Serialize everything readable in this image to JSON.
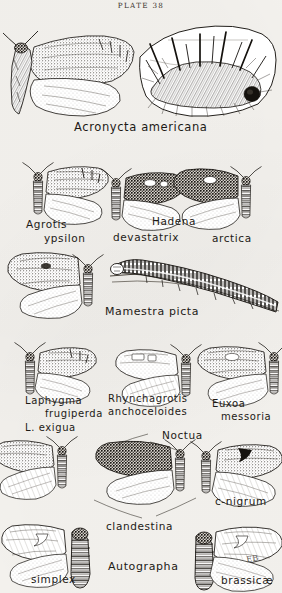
{
  "plate": {
    "header": "PLATE 38",
    "signature": "EB",
    "ink_color": "#16130f",
    "paper_color": "#f6f4f0"
  },
  "captions": [
    {
      "id": "acronycta-americana",
      "text": "Acronycta americana",
      "x": 74,
      "y": 122,
      "size": 11.5
    },
    {
      "id": "agrotis",
      "text": "Agrotis",
      "x": 26,
      "y": 219,
      "size": 10.5
    },
    {
      "id": "ypsilon",
      "text": "ypsilon",
      "x": 44,
      "y": 233,
      "size": 10.5
    },
    {
      "id": "hadena",
      "text": "Hadena",
      "x": 152,
      "y": 216,
      "size": 10.5
    },
    {
      "id": "devastatrix",
      "text": "devastatrix",
      "x": 113,
      "y": 232,
      "size": 10.5
    },
    {
      "id": "arctica",
      "text": "arctica",
      "x": 212,
      "y": 233,
      "size": 10.5
    },
    {
      "id": "mamestra-picta",
      "text": "Mamestra picta",
      "x": 105,
      "y": 306,
      "size": 11
    },
    {
      "id": "laphygma",
      "text": "Laphygma",
      "x": 25,
      "y": 396,
      "size": 10
    },
    {
      "id": "frugiperda",
      "text": "frugiperda",
      "x": 45,
      "y": 409,
      "size": 10
    },
    {
      "id": "l-exigua",
      "text": "L. exigua",
      "x": 25,
      "y": 423,
      "size": 10
    },
    {
      "id": "rhynchagrotis",
      "text": "Rhynchagrotis",
      "x": 108,
      "y": 394,
      "size": 10
    },
    {
      "id": "anchoceloides",
      "text": "anchoceloides",
      "x": 108,
      "y": 407,
      "size": 10
    },
    {
      "id": "euxoa",
      "text": "Euxoa",
      "x": 212,
      "y": 399,
      "size": 10
    },
    {
      "id": "messoria",
      "text": "messoria",
      "x": 221,
      "y": 412,
      "size": 10
    },
    {
      "id": "noctua",
      "text": "Noctua",
      "x": 162,
      "y": 430,
      "size": 10.5
    },
    {
      "id": "c-nigrum",
      "text": "c-nigrum",
      "x": 215,
      "y": 496,
      "size": 10.5
    },
    {
      "id": "clandestina",
      "text": "clandestina",
      "x": 106,
      "y": 521,
      "size": 10.5
    },
    {
      "id": "autographa",
      "text": "Autographa",
      "x": 108,
      "y": 561,
      "size": 11
    },
    {
      "id": "simplex",
      "text": "simplex",
      "x": 31,
      "y": 574,
      "size": 10.5
    },
    {
      "id": "brassicae",
      "text": "brassicæ",
      "x": 221,
      "y": 575,
      "size": 10.5
    }
  ],
  "figures": [
    {
      "id": "acronycta-americana-moth",
      "kind": "moth",
      "row": 1
    },
    {
      "id": "acronycta-americana-larva",
      "kind": "caterpillar-hairy-on-leaf",
      "row": 1
    },
    {
      "id": "agrotis-ypsilon-moth",
      "kind": "moth",
      "row": 2
    },
    {
      "id": "hadena-devastatrix-moth",
      "kind": "moth",
      "row": 2
    },
    {
      "id": "hadena-arctica-moth",
      "kind": "moth",
      "row": 2
    },
    {
      "id": "mamestra-picta-moth",
      "kind": "moth",
      "row": 3
    },
    {
      "id": "mamestra-picta-larva",
      "kind": "caterpillar-striped",
      "row": 3
    },
    {
      "id": "laphygma-frugiperda-moth",
      "kind": "moth",
      "row": 4
    },
    {
      "id": "rhynchagrotis-anchoceloides-moth",
      "kind": "moth",
      "row": 4
    },
    {
      "id": "euxoa-messoria-moth",
      "kind": "moth",
      "row": 4
    },
    {
      "id": "noctua-clandestina-moth-left",
      "kind": "moth",
      "row": 5
    },
    {
      "id": "noctua-clandestina-moth-mid",
      "kind": "moth",
      "row": 5
    },
    {
      "id": "noctua-c-nigrum-moth",
      "kind": "moth",
      "row": 5
    },
    {
      "id": "autographa-simplex-moth",
      "kind": "moth",
      "row": 6
    },
    {
      "id": "autographa-simplex-larva",
      "kind": "caterpillar-dark",
      "row": 6
    },
    {
      "id": "autographa-brassicae-larva",
      "kind": "caterpillar-dark",
      "row": 6
    },
    {
      "id": "autographa-brassicae-moth",
      "kind": "moth",
      "row": 6
    }
  ]
}
